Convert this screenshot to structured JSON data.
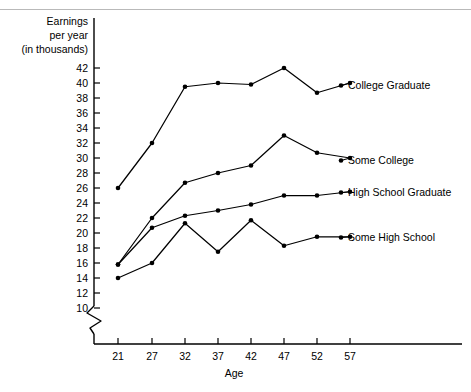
{
  "chart_data": {
    "type": "line",
    "title": "",
    "xlabel": "Age",
    "ylabel": "Earnings per year (in thousands)",
    "ylabel_lines": [
      "Earnings",
      "per year",
      "(in thousands)"
    ],
    "categories": [
      21,
      27,
      32,
      37,
      42,
      47,
      52,
      57
    ],
    "x": [
      21,
      27,
      32,
      37,
      42,
      47,
      52,
      57
    ],
    "xtick_labels": [
      "21",
      "27",
      "32",
      "37",
      "42",
      "47",
      "52",
      "57"
    ],
    "ytick_labels": [
      "42",
      "40",
      "38",
      "36",
      "34",
      "32",
      "30",
      "28",
      "26",
      "24",
      "22",
      "20",
      "18",
      "16",
      "14",
      "12",
      "10"
    ],
    "yticks": [
      42,
      40,
      38,
      36,
      34,
      32,
      30,
      28,
      26,
      24,
      22,
      20,
      18,
      16,
      14,
      12,
      10
    ],
    "ylim": [
      10,
      43
    ],
    "xlim": [
      18,
      60
    ],
    "axis_break": true,
    "grid": false,
    "legend_position": "right-inline",
    "series": [
      {
        "name": "College Graduate",
        "values": [
          26,
          32,
          39.5,
          40,
          39.8,
          42,
          38.7,
          40
        ]
      },
      {
        "name": "Some College",
        "values": [
          15.8,
          22,
          26.7,
          28,
          29,
          33,
          30.7,
          30
        ]
      },
      {
        "name": "High School Graduate",
        "values": [
          15.8,
          20.7,
          22.3,
          23,
          23.8,
          25,
          25,
          25.5
        ]
      },
      {
        "name": "Some High School",
        "values": [
          14,
          16,
          21.3,
          17.5,
          21.7,
          18.3,
          19.5,
          19.5
        ]
      }
    ]
  }
}
